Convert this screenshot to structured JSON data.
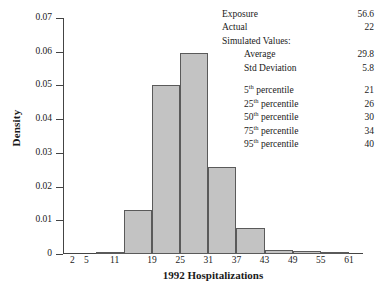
{
  "chart_data": {
    "type": "bar",
    "title": "",
    "xlabel": "1992 Hospitalizations",
    "ylabel": "Density",
    "xlim": [
      0,
      64
    ],
    "ylim": [
      0,
      0.07
    ],
    "grid": false,
    "legend": "none",
    "xticks": [
      2,
      5,
      11,
      19,
      25,
      31,
      37,
      43,
      49,
      55,
      61
    ],
    "xtick_labels": [
      "2",
      "5",
      "11",
      "19",
      "25",
      "31",
      "37",
      "43",
      "49",
      "55",
      "61"
    ],
    "yticks": [
      0,
      0.01,
      0.02,
      0.03,
      0.04,
      0.05,
      0.06,
      0.07
    ],
    "ytick_labels": [
      "0",
      "0.01",
      "0.02",
      "0.03",
      "0.04",
      "0.05",
      "0.06",
      "0.07"
    ],
    "bin_edges": [
      1,
      7,
      13,
      19,
      25,
      31,
      37,
      43,
      49,
      55,
      61
    ],
    "bins": [
      {
        "label": "1-7",
        "x0": 1,
        "x1": 7,
        "density": 0.0
      },
      {
        "label": "7-13",
        "x0": 7,
        "x1": 13,
        "density": 0.0004
      },
      {
        "label": "13-19",
        "x0": 13,
        "x1": 19,
        "density": 0.013
      },
      {
        "label": "19-25",
        "x0": 19,
        "x1": 25,
        "density": 0.05
      },
      {
        "label": "25-31",
        "x0": 25,
        "x1": 31,
        "density": 0.0595
      },
      {
        "label": "31-37",
        "x0": 31,
        "x1": 37,
        "density": 0.0259
      },
      {
        "label": "37-43",
        "x0": 37,
        "x1": 43,
        "density": 0.0078
      },
      {
        "label": "43-49",
        "x0": 43,
        "x1": 49,
        "density": 0.0013
      },
      {
        "label": "49-55",
        "x0": 49,
        "x1": 55,
        "density": 0.0008
      },
      {
        "label": "55-61",
        "x0": 55,
        "x1": 61,
        "density": 0.0002
      }
    ],
    "values": [
      0.0,
      0.0004,
      0.013,
      0.05,
      0.0595,
      0.0259,
      0.0078,
      0.0013,
      0.0008,
      0.0002
    ],
    "categories": [
      "1-7",
      "7-13",
      "13-19",
      "19-25",
      "25-31",
      "31-37",
      "37-43",
      "43-49",
      "49-55",
      "55-61"
    ],
    "bar_fill_color": "#c3c3c3",
    "bar_edge_color": "#5a5a5a",
    "annotations": {
      "exposure_label": "Exposure",
      "exposure_value": "56.6",
      "actual_label": "Actual",
      "actual_value": "22",
      "simulated_header": "Simulated Values:",
      "average_label": "Average",
      "average_value": "29.8",
      "std_label": "Std Deviation",
      "std_value": "5.8",
      "percentiles": [
        {
          "rank": "5",
          "suffix": "th",
          "label": " percentile",
          "value": "21"
        },
        {
          "rank": "25",
          "suffix": "th",
          "label": " percentile",
          "value": "26"
        },
        {
          "rank": "50",
          "suffix": "th",
          "label": " percentile",
          "value": "30"
        },
        {
          "rank": "75",
          "suffix": "th",
          "label": " percentile",
          "value": "34"
        },
        {
          "rank": "95",
          "suffix": "th",
          "label": " percentile",
          "value": "40"
        }
      ]
    }
  }
}
